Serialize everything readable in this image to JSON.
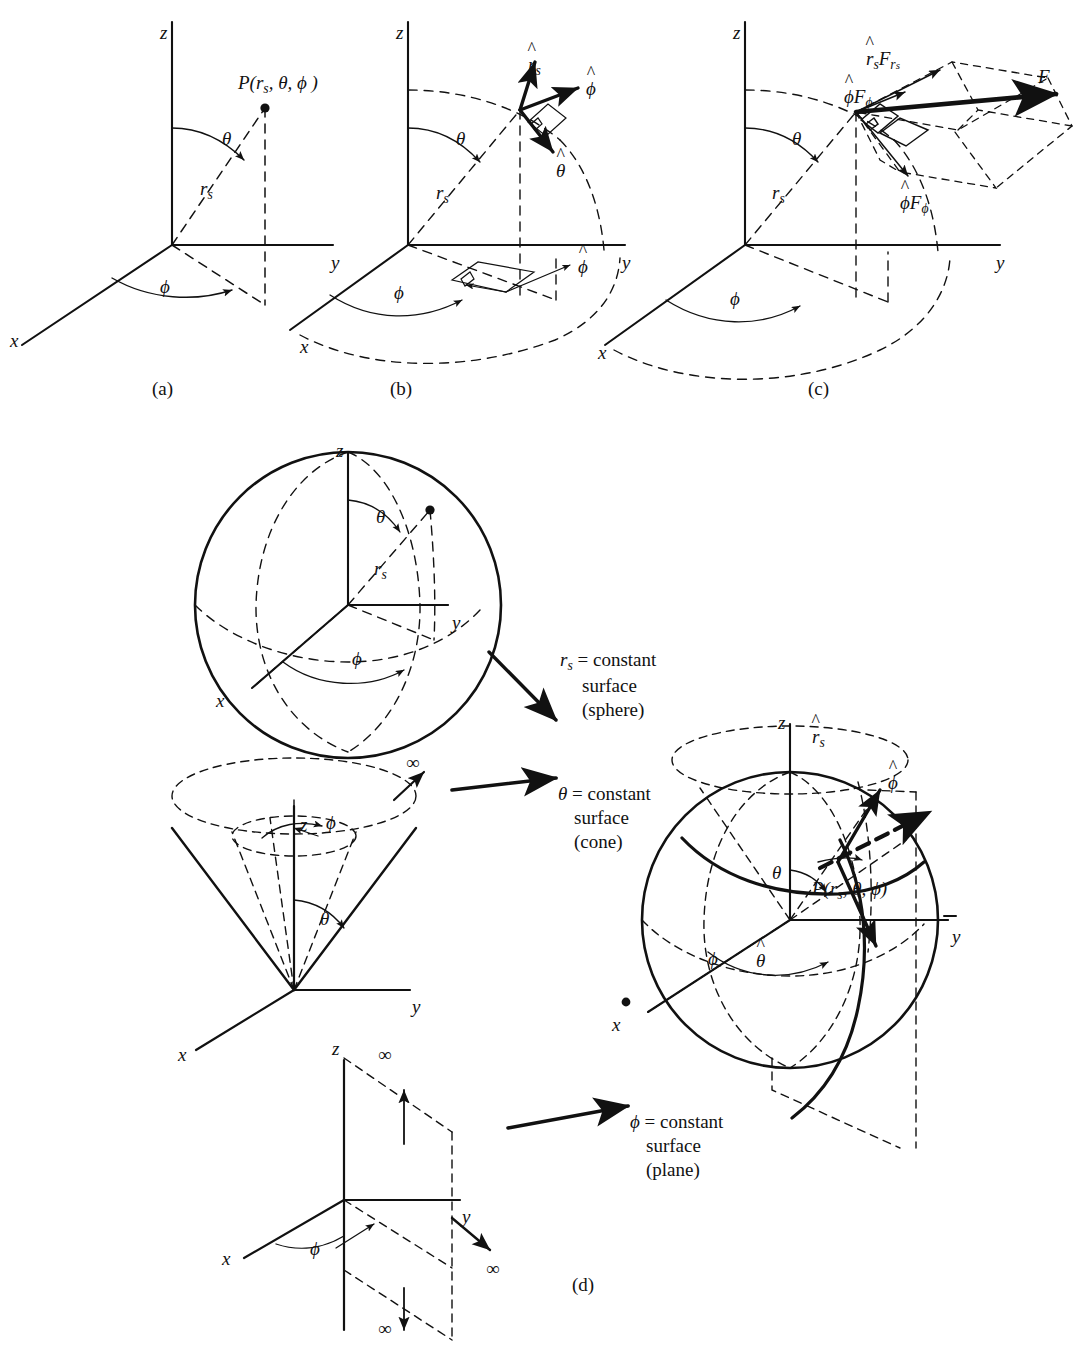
{
  "figure": {
    "panel_labels": [
      "(a)",
      "(b)",
      "(c)",
      "(d)"
    ],
    "ink_color": "#111111",
    "background": "#ffffff"
  },
  "axes": {
    "x": "x",
    "y": "y",
    "z": "z"
  },
  "symbols": {
    "theta": "θ",
    "phi": "ϕ",
    "r_s": "r",
    "r_sub": "s",
    "infinity": "∞",
    "point_label_prefix": "P(",
    "point_label_suffix": ")"
  },
  "panel_a": {
    "label": "(a)",
    "point": "P(rₛ, θ, ϕ)",
    "radial_label": "rₛ",
    "theta_label": "θ",
    "phi_label": "ϕ",
    "axis_x": "x",
    "axis_y": "y",
    "axis_z": "z"
  },
  "panel_b": {
    "label": "(b)",
    "unit_vectors": [
      "r̂ₛ",
      "ϕ̂",
      "θ̂",
      "ϕ̂"
    ],
    "radial_label": "rₛ",
    "theta_label": "θ",
    "phi_label": "ϕ",
    "axis_x": "x",
    "axis_y": "y",
    "axis_z": "z"
  },
  "panel_c": {
    "label": "(c)",
    "vector": "F",
    "components": [
      "r̂ₛFᵣₛ",
      "ϕ̂Fϕ",
      "ϕ̂Fϕ"
    ],
    "radial_label": "rₛ",
    "theta_label": "θ",
    "phi_label": "ϕ",
    "axis_x": "x",
    "axis_y": "y",
    "axis_z": "z"
  },
  "panel_d": {
    "label": "(d)",
    "sphere": {
      "caption_line1": "= constant",
      "caption_line2": "surface",
      "caption_line3": "(sphere)",
      "caption_symbol": "rₛ",
      "theta_label": "θ",
      "phi_label": "ϕ",
      "radial_label": "rₛ",
      "axis_x": "x",
      "axis_y": "y",
      "axis_z": "z"
    },
    "cone": {
      "caption_line1": "= constant",
      "caption_line2": "surface",
      "caption_line3": "(cone)",
      "caption_symbol": "θ",
      "theta_label": "θ",
      "phi_label": "ϕ",
      "infinity": "∞",
      "axis_x": "x",
      "axis_y": "y",
      "axis_z": "z"
    },
    "plane": {
      "caption_line1": "= constant",
      "caption_line2": "surface",
      "caption_line3": "(plane)",
      "caption_symbol": "ϕ",
      "phi_label": "ϕ",
      "infinity_top": "∞",
      "infinity_right": "∞",
      "infinity_bottom": "∞",
      "axis_x": "x",
      "axis_y": "y",
      "axis_z": "z"
    },
    "combined": {
      "point": "P(rₛ, θ, ϕ)",
      "unit_vectors": [
        "r̂ₛ",
        "ϕ̂",
        "θ̂"
      ],
      "theta_label": "θ",
      "phi_label": "ϕ",
      "axis_x": "x",
      "axis_y": "y",
      "axis_z": "z"
    }
  }
}
